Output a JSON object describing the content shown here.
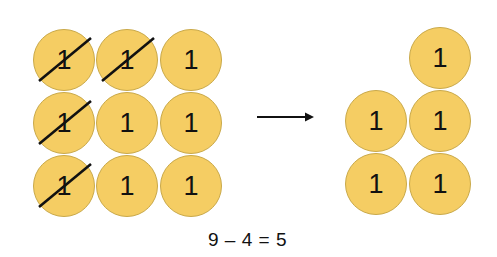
{
  "diagram": {
    "type": "subtraction-with-counters",
    "counter_value": "1",
    "colors": {
      "counter_fill": "#f5cd63",
      "counter_border": "#c9a94a",
      "text": "#111111",
      "cross_out": "#111111"
    },
    "before": {
      "label": "before",
      "counters": [
        {
          "row": 0,
          "col": 0,
          "value": "1",
          "crossed": true,
          "x": 33,
          "y": 29
        },
        {
          "row": 0,
          "col": 1,
          "value": "1",
          "crossed": true,
          "x": 96,
          "y": 29
        },
        {
          "row": 0,
          "col": 2,
          "value": "1",
          "crossed": false,
          "x": 160,
          "y": 29
        },
        {
          "row": 1,
          "col": 0,
          "value": "1",
          "crossed": true,
          "x": 33,
          "y": 92
        },
        {
          "row": 1,
          "col": 1,
          "value": "1",
          "crossed": false,
          "x": 96,
          "y": 92
        },
        {
          "row": 1,
          "col": 2,
          "value": "1",
          "crossed": false,
          "x": 160,
          "y": 92
        },
        {
          "row": 2,
          "col": 0,
          "value": "1",
          "crossed": true,
          "x": 33,
          "y": 155
        },
        {
          "row": 2,
          "col": 1,
          "value": "1",
          "crossed": false,
          "x": 96,
          "y": 155
        },
        {
          "row": 2,
          "col": 2,
          "value": "1",
          "crossed": false,
          "x": 160,
          "y": 155
        }
      ]
    },
    "arrow": {
      "direction": "right",
      "icon": "right-arrow-icon"
    },
    "after": {
      "label": "after",
      "counters": [
        {
          "value": "1",
          "x": 409,
          "y": 27
        },
        {
          "value": "1",
          "x": 345,
          "y": 90
        },
        {
          "value": "1",
          "x": 409,
          "y": 90
        },
        {
          "value": "1",
          "x": 345,
          "y": 153
        },
        {
          "value": "1",
          "x": 409,
          "y": 153
        }
      ]
    },
    "equation": "9 – 4 = 5",
    "total_before": 9,
    "removed": 4,
    "result": 5
  }
}
